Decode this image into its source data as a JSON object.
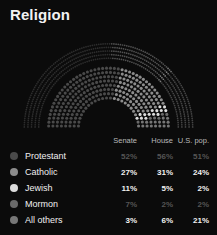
{
  "title": "Religion",
  "table": {
    "columns": [
      "",
      "Senate",
      "House",
      "U.S. pop."
    ],
    "rows": [
      {
        "label": "Protestant",
        "senate": "52%",
        "house": "56%",
        "us_pop": "51%",
        "color": "#4a4a4a",
        "dim": true
      },
      {
        "label": "Catholic",
        "senate": "27%",
        "house": "31%",
        "us_pop": "24%",
        "color": "#8c8c8c",
        "dim": false
      },
      {
        "label": "Jewish",
        "senate": "11%",
        "house": "5%",
        "us_pop": "2%",
        "color": "#dcdcdc",
        "dim": false
      },
      {
        "label": "Mormon",
        "senate": "7%",
        "house": "2%",
        "us_pop": "2%",
        "color": "#6a6a6a",
        "dim": true
      },
      {
        "label": "All others",
        "senate": "3%",
        "house": "6%",
        "us_pop": "21%",
        "color": "#777777",
        "dim": false
      }
    ]
  },
  "chart_data": {
    "type": "pie",
    "title": "Religion",
    "subtype": "nested-semicircle-dot-arc",
    "xlabel": "",
    "ylabel": "",
    "categories": [
      "Protestant",
      "Catholic",
      "Jewish",
      "Mormon",
      "All others"
    ],
    "series": [
      {
        "name": "Senate",
        "ring": "inner",
        "values": [
          52,
          27,
          11,
          7,
          3
        ]
      },
      {
        "name": "House",
        "ring": "middle",
        "values": [
          56,
          31,
          5,
          2,
          6
        ]
      },
      {
        "name": "U.S. pop.",
        "ring": "outer",
        "values": [
          51,
          24,
          2,
          2,
          21
        ]
      }
    ],
    "slice_colors": [
      "#4a4a4a",
      "#8c8c8c",
      "#dcdcdc",
      "#6a6a6a",
      "#777777"
    ],
    "legend_position": "bottom",
    "grid": false,
    "background": "#0b0b0b"
  },
  "colors": {
    "background": "#0b0b0b",
    "text": "#f0f0f0",
    "muted_text": "#b9b9b9",
    "dim_value": "#555555"
  }
}
